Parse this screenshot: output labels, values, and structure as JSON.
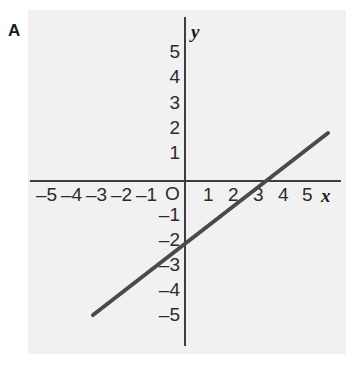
{
  "figure": {
    "panel_letter": "A",
    "background_color": "#f1f1f1",
    "axis_color": "#3d3d3d",
    "line_color": "#4a4a4a"
  },
  "axes": {
    "x_name": "x",
    "y_name": "y",
    "origin_label": "O",
    "x_tick_labels": [
      "–5",
      "–4",
      "–3",
      "–2",
      "–1",
      "1",
      "2",
      "3",
      "4",
      "5"
    ],
    "y_tick_labels": [
      "5",
      "4",
      "3",
      "2",
      "1",
      "–1",
      "–2",
      "–3",
      "–4",
      "–5"
    ]
  },
  "chart_data": {
    "type": "line",
    "title": "A",
    "xlabel": "x",
    "ylabel": "y",
    "grid": false,
    "legend": "none",
    "xlim": [
      -6,
      6
    ],
    "ylim": [
      -6,
      6
    ],
    "xticks": [
      -5,
      -4,
      -3,
      -2,
      -1,
      0,
      1,
      2,
      3,
      4,
      5
    ],
    "yticks": [
      -5,
      -4,
      -3,
      -2,
      -1,
      0,
      1,
      2,
      3,
      4,
      5
    ],
    "xtick_labels": [
      "–5",
      "–4",
      "–3",
      "–2",
      "–1",
      "O",
      "1",
      "2",
      "3",
      "4",
      "5"
    ],
    "ytick_labels": [
      "–5",
      "–4",
      "–3",
      "–2",
      "–1",
      "",
      "1",
      "2",
      "3",
      "4",
      "5"
    ],
    "series": [
      {
        "name": "line",
        "equation": "y = (2/3)x - 2",
        "slope": 0.6667,
        "y_intercept": -2,
        "x_intercept": 3,
        "x": [
          -3.7,
          5.8
        ],
        "y": [
          -4.5,
          1.9
        ],
        "points": [
          [
            -3.7,
            -4.5
          ],
          [
            0,
            -2
          ],
          [
            3,
            0
          ],
          [
            5.8,
            1.9
          ]
        ]
      }
    ]
  },
  "tick_positions": {
    "x_neg": [
      {
        "label": "–5",
        "left": 36
      },
      {
        "label": "–4",
        "left": 61
      },
      {
        "label": "–3",
        "left": 86
      },
      {
        "label": "–2",
        "left": 111
      },
      {
        "label": "–1",
        "left": 136
      }
    ],
    "x_pos": [
      {
        "label": "1",
        "left": 203
      },
      {
        "label": "2",
        "left": 228
      },
      {
        "label": "3",
        "left": 253
      },
      {
        "label": "4",
        "left": 278
      },
      {
        "label": "5",
        "left": 302
      }
    ],
    "y_pos": [
      {
        "label": "5",
        "top": 42
      },
      {
        "label": "4",
        "top": 67
      },
      {
        "label": "3",
        "top": 93
      },
      {
        "label": "2",
        "top": 118
      },
      {
        "label": "1",
        "top": 143
      }
    ],
    "y_neg": [
      {
        "label": "–1",
        "top": 205
      },
      {
        "label": "–2",
        "top": 230
      },
      {
        "label": "–3",
        "top": 255
      },
      {
        "label": "–4",
        "top": 280
      },
      {
        "label": "–5",
        "top": 305
      }
    ]
  }
}
